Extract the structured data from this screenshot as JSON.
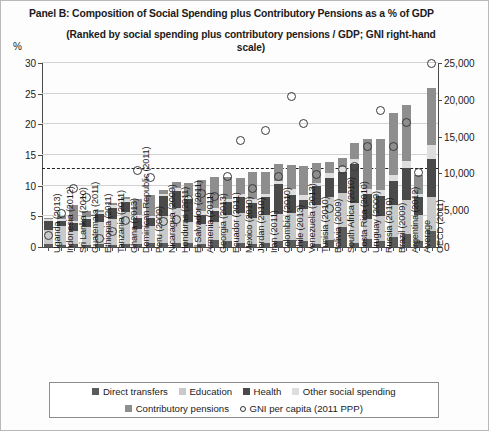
{
  "chart": {
    "title": "Panel B: Composition of Social Spending plus Contributory Pensions as a % of GDP",
    "subtitle": "(Ranked by social spending plus contributory pensions / GDP; GNI right-hand scale)",
    "y_unit_label": "%"
  },
  "legend": {
    "items": [
      {
        "label": "Direct transfers",
        "marker": "square",
        "color": "#5b5b5b"
      },
      {
        "label": "Education",
        "marker": "square",
        "color": "#c9c9c9"
      },
      {
        "label": "Health",
        "marker": "square",
        "color": "#4a4a4a"
      },
      {
        "label": "Other social spending",
        "marker": "square",
        "color": "#dedede"
      },
      {
        "label": "Contributory pensions",
        "marker": "square",
        "color": "#8e8e8e"
      },
      {
        "label": "GNI per capita (2011 PPP)",
        "marker": "circle",
        "color": "#333333"
      }
    ]
  },
  "chart_data": {
    "type": "bar",
    "title": "Panel B: Composition of Social Spending plus Contributory Pensions as a % of GDP",
    "subtitle": "(Ranked by social spending plus contributory pensions / GDP; GNI right-hand scale)",
    "xlabel": "",
    "ylabel": "%",
    "ylim": [
      0,
      30
    ],
    "yticks": [
      0,
      5,
      10,
      15,
      20,
      25,
      30
    ],
    "y2label": "GNI per capita (2011 PPP)",
    "y2lim": [
      0,
      25000
    ],
    "y2ticks": [
      "0",
      "5,000",
      "10,000",
      "15,000",
      "20,000",
      "25,000"
    ],
    "grid": true,
    "stacked": true,
    "legend_position": "bottom",
    "average_line": 12.8,
    "categories": [
      "Uganda (2013)",
      "Indonesia (2012)",
      "Sri Lanka (2010)",
      "Guatemala (2011)",
      "Ethiopia (2011)",
      "Tanzania (2011)",
      "Ghana (2013)",
      "Dominican Republic (2011)",
      "Peru (2009)",
      "Nicaragua (2009)",
      "Honduras (2011)",
      "El Salvador (2011)",
      "Armenia (2011)",
      "Georgia (2013)",
      "Ecuador (2011)",
      "Mexico (2010)",
      "Jordan (2010)",
      "Iran (2011)",
      "Colombia (2010)",
      "Chile (2013)",
      "Venezuela (2013)",
      "Tunisia (2010)",
      "Bolivia (2009)",
      "South Africa (2010)",
      "Costa Rica (2010)",
      "Uruguay (2009)",
      "Russia (2010)",
      "Brazil (2009)",
      "Argentina (2012)",
      "Average",
      "OECD (2011)"
    ],
    "series": [
      {
        "name": "Direct transfers",
        "color": "#5b5b5b",
        "values": [
          0.5,
          0.4,
          0.5,
          0.4,
          0.5,
          0.4,
          0.5,
          0.5,
          0.6,
          0.6,
          0.6,
          0.6,
          0.5,
          1.2,
          0.9,
          0.7,
          0.5,
          0.7,
          0.9,
          1.2,
          1.0,
          0.5,
          1.1,
          3.3,
          0.7,
          1.3,
          1.0,
          1.6,
          2.2,
          0.9,
          2.6
        ]
      },
      {
        "name": "Education",
        "color": "#c9c9c9",
        "values": [
          2.2,
          3.0,
          2.1,
          2.9,
          3.5,
          4.2,
          5.2,
          2.5,
          2.9,
          4.5,
          5.8,
          3.5,
          3.3,
          2.9,
          4.3,
          4.9,
          4.2,
          4.6,
          4.5,
          4.4,
          5.2,
          6.3,
          7.0,
          5.5,
          6.5,
          3.2,
          4.1,
          5.2,
          5.5,
          4.3,
          5.6
        ]
      },
      {
        "name": "Health",
        "color": "#4a4a4a",
        "values": [
          1.5,
          0.9,
          1.3,
          1.2,
          1.4,
          1.8,
          1.6,
          1.8,
          1.2,
          3.2,
          2.8,
          3.8,
          1.4,
          1.8,
          2.1,
          2.6,
          2.5,
          2.8,
          4.8,
          2.9,
          1.5,
          3.1,
          3.2,
          3.5,
          6.3,
          4.2,
          3.2,
          4.0,
          5.2,
          2.9,
          6.2
        ]
      },
      {
        "name": "Other social spending",
        "color": "#dedede",
        "values": [
          0.3,
          0.3,
          0.4,
          0.4,
          0.3,
          0.4,
          0.5,
          0.5,
          0.4,
          0.4,
          0.5,
          0.4,
          0.6,
          0.5,
          0.6,
          0.5,
          0.7,
          0.6,
          0.6,
          0.9,
          0.8,
          0.6,
          0.8,
          0.7,
          0.9,
          0.7,
          1.0,
          1.0,
          1.1,
          0.6,
          2.2
        ]
      },
      {
        "name": "Contributory pensions",
        "color": "#8e8e8e",
        "values": [
          0.2,
          0.5,
          2.6,
          1.0,
          0.4,
          0.3,
          0.3,
          2.6,
          3.4,
          0.6,
          0.9,
          2.2,
          5.1,
          5.0,
          3.5,
          2.6,
          4.3,
          3.6,
          2.8,
          3.9,
          4.7,
          3.2,
          1.8,
          1.5,
          2.5,
          8.2,
          8.3,
          10.0,
          9.2,
          3.1,
          9.4
        ]
      }
    ],
    "gni_per_capita": [
      1600,
      4600,
      7900,
      6700,
      1200,
      2100,
      3600,
      10400,
      9400,
      3500,
      3700,
      6400,
      7300,
      6800,
      9600,
      14500,
      8000,
      15800,
      9600,
      20400,
      16800,
      9800,
      5200,
      10500,
      11000,
      13600,
      18500,
      13600,
      16900,
      10100,
      25000
    ]
  }
}
